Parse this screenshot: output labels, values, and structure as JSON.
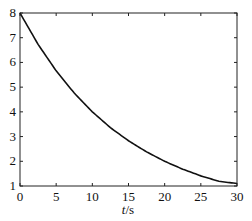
{
  "chart_data": {
    "type": "line",
    "title": "",
    "xlabel": "t/s",
    "xlabel_italic_part": "t",
    "xlabel_unit_part": "/s",
    "ylabel": "",
    "xlim": [
      0,
      30
    ],
    "ylim": [
      1,
      8
    ],
    "xticks": [
      0,
      5,
      10,
      15,
      20,
      25,
      30
    ],
    "yticks": [
      1,
      2,
      3,
      4,
      5,
      6,
      7,
      8
    ],
    "grid": false,
    "legend": null,
    "series": [
      {
        "name": "curve",
        "color": "#111111",
        "x": [
          0,
          2.5,
          5,
          7.5,
          10,
          12.5,
          15,
          17.5,
          20,
          22.5,
          25,
          27.5,
          30
        ],
        "values": [
          8.0,
          6.73,
          5.66,
          4.76,
          4.0,
          3.36,
          2.83,
          2.38,
          2.0,
          1.68,
          1.41,
          1.19,
          1.1
        ]
      }
    ]
  }
}
